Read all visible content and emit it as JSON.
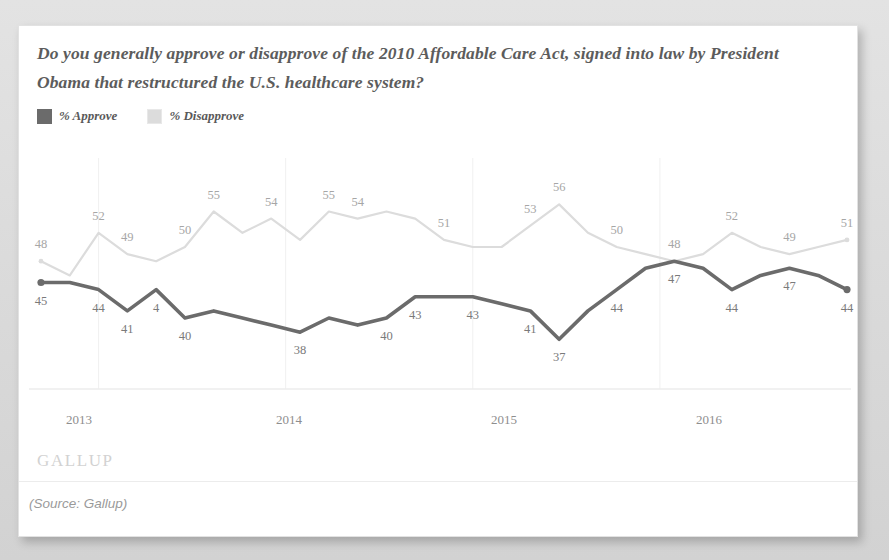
{
  "card": {
    "title": "Do you generally approve or disapprove of the 2010 Affordable Care Act, signed into law by President Obama that restructured the U.S. healthcare system?",
    "watermark": "GALLUP",
    "source": "(Source: Gallup)"
  },
  "legend": {
    "items": [
      {
        "label": "% Approve",
        "color": "#6b6b6b"
      },
      {
        "label": "% Disapprove",
        "color": "#dcdcdc"
      }
    ]
  },
  "chart_data": {
    "type": "line",
    "title": "Do you generally approve or disapprove of the 2010 Affordable Care Act, signed into law by President Obama that restructured the U.S. healthcare system?",
    "xlabel": "",
    "ylabel": "",
    "ylim": [
      30,
      60
    ],
    "grid": "vertical-only",
    "legend_position": "top-left",
    "x_tick_labels": [
      "2013",
      "2014",
      "2015",
      "2016"
    ],
    "x_tick_index": [
      1,
      7,
      13,
      19
    ],
    "n_points": 24,
    "series": [
      {
        "name": "% Approve",
        "color": "#6b6b6b",
        "values": [
          45,
          45,
          44,
          41,
          44,
          40,
          41,
          40,
          39,
          38,
          40,
          39,
          40,
          43,
          43,
          43,
          42,
          41,
          37,
          41,
          44,
          47,
          48,
          47,
          44,
          46,
          47,
          46,
          44
        ],
        "labels": [
          {
            "index": 0,
            "text": "45",
            "position": "below"
          },
          {
            "index": 2,
            "text": "44",
            "position": "below"
          },
          {
            "index": 3,
            "text": "41",
            "position": "below"
          },
          {
            "index": 4,
            "text": "4",
            "position": "below"
          },
          {
            "index": 5,
            "text": "40",
            "position": "below"
          },
          {
            "index": 9,
            "text": "38",
            "position": "below"
          },
          {
            "index": 12,
            "text": "40",
            "position": "below"
          },
          {
            "index": 13,
            "text": "43",
            "position": "below"
          },
          {
            "index": 15,
            "text": "43",
            "position": "below"
          },
          {
            "index": 17,
            "text": "41",
            "position": "below"
          },
          {
            "index": 18,
            "text": "37",
            "position": "below"
          },
          {
            "index": 20,
            "text": "44",
            "position": "below"
          },
          {
            "index": 22,
            "text": "47",
            "position": "below"
          },
          {
            "index": 24,
            "text": "44",
            "position": "below"
          },
          {
            "index": 26,
            "text": "47",
            "position": "below"
          },
          {
            "index": 28,
            "text": "44",
            "position": "below"
          }
        ]
      },
      {
        "name": "% Disapprove",
        "color": "#dcdcdc",
        "values": [
          48,
          46,
          52,
          49,
          48,
          50,
          55,
          52,
          54,
          51,
          55,
          54,
          55,
          54,
          51,
          50,
          50,
          53,
          56,
          52,
          50,
          49,
          48,
          49,
          52,
          50,
          49,
          50,
          51
        ],
        "labels": [
          {
            "index": 0,
            "text": "48",
            "position": "above"
          },
          {
            "index": 2,
            "text": "52",
            "position": "above"
          },
          {
            "index": 3,
            "text": "49",
            "position": "above"
          },
          {
            "index": 5,
            "text": "50",
            "position": "above"
          },
          {
            "index": 6,
            "text": "55",
            "position": "above"
          },
          {
            "index": 8,
            "text": "54",
            "position": "above"
          },
          {
            "index": 10,
            "text": "55",
            "position": "above"
          },
          {
            "index": 11,
            "text": "54",
            "position": "above"
          },
          {
            "index": 14,
            "text": "51",
            "position": "above"
          },
          {
            "index": 17,
            "text": "53",
            "position": "above"
          },
          {
            "index": 18,
            "text": "56",
            "position": "above"
          },
          {
            "index": 20,
            "text": "50",
            "position": "above"
          },
          {
            "index": 22,
            "text": "48",
            "position": "above"
          },
          {
            "index": 24,
            "text": "52",
            "position": "above"
          },
          {
            "index": 26,
            "text": "49",
            "position": "above"
          },
          {
            "index": 28,
            "text": "51",
            "position": "above"
          }
        ]
      }
    ]
  }
}
